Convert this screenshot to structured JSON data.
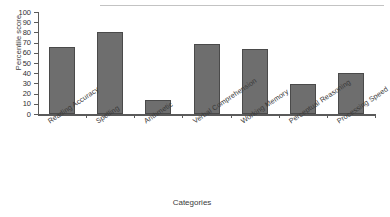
{
  "chart_data": {
    "type": "bar",
    "title": "",
    "xlabel": "Categories",
    "ylabel": "Percentile score",
    "categories": [
      "Reading Accuracy",
      "Spelling",
      "Arithmetic",
      "Verbal Comprehension",
      "Working Memory",
      "Perceptual Reasoning",
      "Processing Speed"
    ],
    "values": [
      66,
      80,
      14,
      69,
      64,
      29,
      40
    ],
    "ylim": [
      0,
      100
    ],
    "yticks": [
      0,
      10,
      20,
      30,
      40,
      50,
      60,
      70,
      80,
      90,
      100
    ],
    "ytick_labels": [
      "0",
      "10",
      "20",
      "30",
      "40",
      "50",
      "60",
      "70",
      "80",
      "90",
      "100"
    ],
    "grid": false,
    "legend": false,
    "bar_color": "#6e6e6e",
    "bar_edge_color": "#4a4a4a",
    "axis_color": "#5a5a5a"
  }
}
